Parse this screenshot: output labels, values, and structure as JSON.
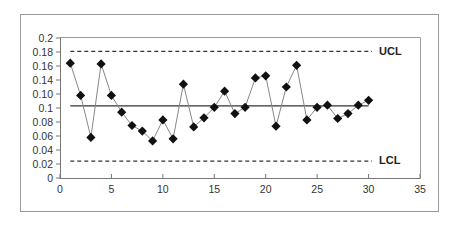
{
  "chart_data": {
    "type": "line",
    "title": "",
    "xlabel": "",
    "ylabel": "",
    "xlim": [
      0,
      35
    ],
    "ylim": [
      0,
      0.2
    ],
    "grid": false,
    "legend": "none",
    "x_ticks": [
      0,
      5,
      10,
      15,
      20,
      25,
      30,
      35
    ],
    "x_tick_labels": [
      "0",
      "5",
      "10",
      "15",
      "20",
      "25",
      "30",
      "35"
    ],
    "y_ticks": [
      0,
      0.02,
      0.04,
      0.06,
      0.08,
      0.1,
      0.12,
      0.14,
      0.16,
      0.18,
      0.2
    ],
    "y_tick_labels": [
      "0",
      "0.02",
      "0.04",
      "0.06",
      "0.08",
      "0.1",
      "0.10",
      "0.14",
      "0.16",
      "0.18",
      "0.2"
    ],
    "series": [
      {
        "name": "Sample proportion",
        "marker": "diamond",
        "x": [
          1,
          2,
          3,
          4,
          5,
          6,
          7,
          8,
          9,
          10,
          11,
          12,
          13,
          14,
          15,
          16,
          17,
          18,
          19,
          20,
          21,
          22,
          23,
          24,
          25,
          26,
          27,
          28,
          29,
          30
        ],
        "values": [
          0.164,
          0.118,
          0.058,
          0.163,
          0.118,
          0.094,
          0.075,
          0.067,
          0.053,
          0.083,
          0.056,
          0.134,
          0.073,
          0.086,
          0.101,
          0.124,
          0.092,
          0.101,
          0.143,
          0.146,
          0.074,
          0.13,
          0.161,
          0.083,
          0.101,
          0.104,
          0.085,
          0.092,
          0.104,
          0.111
        ]
      }
    ],
    "reference_lines": [
      {
        "name": "UCL",
        "label": "UCL",
        "y": 0.181,
        "style": "dashed",
        "x_start": 1,
        "x_end": 30
      },
      {
        "name": "Center line",
        "label": "",
        "y": 0.103,
        "style": "solid",
        "x_start": 1,
        "x_end": 30
      },
      {
        "name": "LCL",
        "label": "LCL",
        "y": 0.024,
        "style": "dashed",
        "x_start": 1,
        "x_end": 30
      }
    ]
  },
  "labels": {
    "ucl": "UCL",
    "lcl": "LCL"
  },
  "colors": {
    "marker": "#111111",
    "line": "#888888",
    "center_line": "#333333",
    "limit_line": "#333333",
    "axis": "#777777",
    "frame": "#999999"
  }
}
